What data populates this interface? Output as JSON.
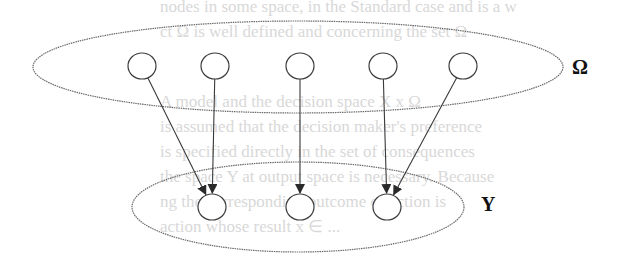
{
  "diagram": {
    "type": "set-mapping",
    "top_set": {
      "label": "Ω",
      "ellipse": {
        "cx": 298,
        "cy": 67,
        "rx": 265,
        "ry": 46
      },
      "nodes": [
        {
          "id": "w1",
          "cx": 142,
          "cy": 66
        },
        {
          "id": "w2",
          "cx": 215,
          "cy": 66
        },
        {
          "id": "w3",
          "cx": 300,
          "cy": 66
        },
        {
          "id": "w4",
          "cx": 383,
          "cy": 66
        },
        {
          "id": "w5",
          "cx": 463,
          "cy": 66
        }
      ]
    },
    "bottom_set": {
      "label": "Y",
      "ellipse": {
        "cx": 298,
        "cy": 207,
        "rx": 166,
        "ry": 45
      },
      "nodes": [
        {
          "id": "y1",
          "cx": 212,
          "cy": 207
        },
        {
          "id": "y2",
          "cx": 300,
          "cy": 207
        },
        {
          "id": "y3",
          "cx": 387,
          "cy": 207
        }
      ]
    },
    "arrows": [
      {
        "from": "w1",
        "to": "y1"
      },
      {
        "from": "w2",
        "to": "y1"
      },
      {
        "from": "w3",
        "to": "y2"
      },
      {
        "from": "w4",
        "to": "y3"
      },
      {
        "from": "w5",
        "to": "y3"
      }
    ],
    "colors": {
      "stroke": "#3a3a3a",
      "ellipse": "#6a6a6a",
      "label": "#111111"
    }
  },
  "background_bleed_text": [
    "nodes in some space, in the Standard case and is a w",
    "ct Ω is well defined and concerning the set Ω",
    "A model and the decision space  X x Ω",
    "is assumed that the decision maker's preference",
    "is specified directly in the set of consequences",
    "the space Y at output space is necessary. Because",
    "ng the corresponding outcome of action is",
    "action  whose  result  x ∈ ..."
  ]
}
